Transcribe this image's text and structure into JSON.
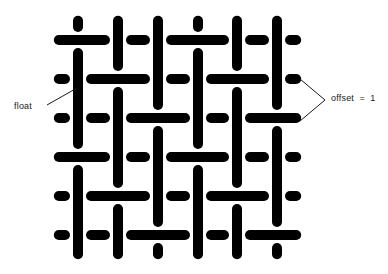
{
  "figure": {
    "type": "weave-diagram",
    "title": "",
    "background_color": "#ffffff",
    "yarn_color": "#000000",
    "annotation_color": "#1a1a1a",
    "grid": {
      "warp_columns": 6,
      "weft_rows": 6,
      "column_centers_px": [
        78,
        118,
        158,
        198,
        237,
        277
      ],
      "row_centers_px": [
        40,
        79,
        118,
        157,
        196,
        235
      ],
      "cell_pitch_px": 39,
      "yarn_thickness_px": 10,
      "float_length_cells": 3,
      "offset": 1
    },
    "weft_over_columns_by_row": [
      [
        1,
        4
      ],
      [
        2,
        5
      ],
      [
        3,
        6
      ],
      [
        1,
        4
      ],
      [
        2,
        5
      ],
      [
        3,
        6
      ]
    ],
    "warp_over_rows_by_column": [
      [
        2,
        3,
        5,
        6
      ],
      [
        1,
        3,
        4,
        6
      ],
      [
        1,
        2,
        4,
        5
      ],
      [
        2,
        3,
        5,
        6
      ],
      [
        1,
        3,
        4,
        6
      ],
      [
        1,
        2,
        4,
        5
      ]
    ]
  },
  "annotations": {
    "float": {
      "text": "float",
      "leader_from_px": [
        47,
        105
      ],
      "leader_to_px": [
        77,
        88
      ]
    },
    "offset": {
      "text": "offset  =  1",
      "bracket_top_px": [
        300,
        79
      ],
      "bracket_tip_px": [
        325,
        100
      ],
      "bracket_bottom_px": [
        300,
        121
      ]
    }
  }
}
